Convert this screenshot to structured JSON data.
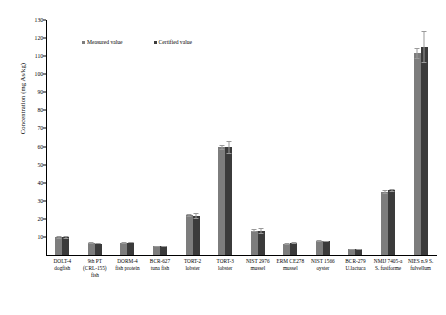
{
  "chart_data": {
    "type": "bar",
    "title": "",
    "xlabel": "",
    "ylabel": "Concentration (mg As/kg)",
    "ylim": [
      0,
      130
    ],
    "ytick_step": 10,
    "yticks": [
      130,
      120,
      110,
      100,
      90,
      80,
      70,
      60,
      50,
      40,
      30,
      20,
      10
    ],
    "grid": false,
    "legend_position": "top-left-inside",
    "categories": [
      "DOLT-4 dogfish",
      "9th PT (CRL-155) fish",
      "DORM-4 fish protein",
      "BCR-627 tuna fish",
      "TORT-2 lobster",
      "TORT-3 lobster",
      "NIST 2976 mussel",
      "ERM CE278 mussel",
      "NIST 1566 oyster",
      "BCR-279 U.lactuca",
      "NMIJ 7405-a S. fusiforme",
      "NIES n.9 S. fulvellum"
    ],
    "category_lines": [
      [
        "DOLT-4",
        "dogfish"
      ],
      [
        "9th PT",
        "(CRL-155)",
        "fish"
      ],
      [
        "DORM-4",
        "fish protein"
      ],
      [
        "BCR-627",
        "tuna fish"
      ],
      [
        "TORT-2",
        "lobster"
      ],
      [
        "TORT-3",
        "lobster"
      ],
      [
        "NIST 2976",
        "mussel"
      ],
      [
        "ERM CE278",
        "mussel"
      ],
      [
        "NIST 1566",
        "oyster"
      ],
      [
        "BCR-279",
        "U.lactuca"
      ],
      [
        "NMIJ 7405-a",
        "S. fusiforme"
      ],
      [
        "NIES n.9 S.",
        "fulvellum"
      ]
    ],
    "series": [
      {
        "name": "Measured value",
        "color": "#7d7d7d",
        "values": [
          9.8,
          6.6,
          6.6,
          4.8,
          22.0,
          59.5,
          13.5,
          6.2,
          7.6,
          3.1,
          35.0,
          111.5
        ],
        "errors": [
          0.7,
          0.5,
          0.5,
          0.4,
          0.9,
          1.6,
          0.9,
          0.5,
          0.6,
          0.3,
          1.2,
          3.0
        ]
      },
      {
        "name": "Certified value",
        "color": "#3b3b3b",
        "values": [
          9.7,
          6.3,
          6.8,
          4.8,
          21.6,
          59.5,
          13.3,
          6.7,
          7.6,
          3.1,
          35.8,
          115.0
        ],
        "errors": [
          0.6,
          0.4,
          0.4,
          0.3,
          1.8,
          3.8,
          1.8,
          0.4,
          0.4,
          0.2,
          0.9,
          9.0
        ]
      }
    ]
  },
  "legend": {
    "items": [
      {
        "label": "Measured value"
      },
      {
        "label": "Certified value"
      }
    ]
  }
}
